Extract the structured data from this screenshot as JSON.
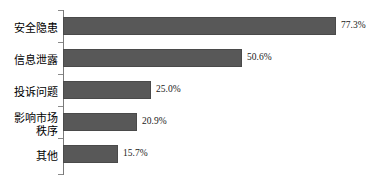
{
  "chart_data": {
    "type": "bar",
    "orientation": "horizontal",
    "title": "",
    "subtitle": "",
    "xlabel": "",
    "ylabel": "",
    "grid": false,
    "legend": null,
    "xlim": [
      0,
      85
    ],
    "axis": {
      "y_axis_visible": true,
      "x_axis_visible": false,
      "ticks_between_categories": true
    },
    "categories": [
      "安全隐患",
      "信息泄露",
      "投诉问题",
      "影响市场秩序",
      "其他"
    ],
    "values": [
      77.3,
      50.6,
      25.0,
      20.9,
      15.7
    ],
    "value_labels": [
      "77.3%",
      "50.6%",
      "25.0%",
      "20.9%",
      "15.7%"
    ],
    "bar_color": "#585858",
    "bar_border_color": "#4a4a4a",
    "axis_color": "#7a7a7a",
    "text_color": "#000000"
  },
  "category_label_lines": [
    [
      "安全隐患"
    ],
    [
      "信息泄露"
    ],
    [
      "投诉问题"
    ],
    [
      "影响市场",
      "秩序"
    ],
    [
      "其他"
    ]
  ],
  "axis_ticks_count": 6
}
